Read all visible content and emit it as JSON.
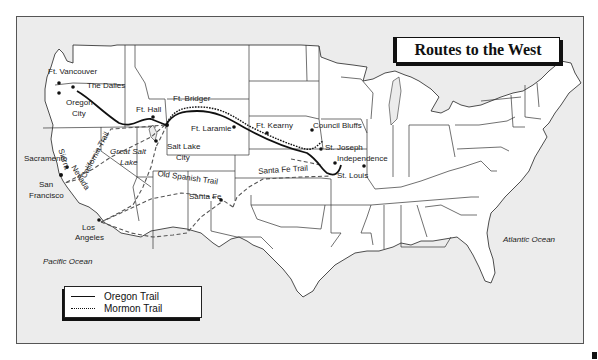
{
  "map": {
    "title": "Routes to the West",
    "legend": [
      {
        "label": "Oregon Trail",
        "style": "solid"
      },
      {
        "label": "Mormon Trail",
        "style": "dotted"
      }
    ],
    "water_labels": {
      "pacific": "Pacific Ocean",
      "atlantic": "Atlantic Ocean",
      "great_salt_lake_1": "Great Salt",
      "great_salt_lake_2": "Lake"
    },
    "places": {
      "ft_vancouver": "Ft. Vancouver",
      "the_dalles": "The Dalles",
      "oregon_city_1": "Oregon",
      "oregon_city_2": "City",
      "ft_hall": "Ft. Hall",
      "ft_bridger": "Ft. Bridger",
      "ft_laramie": "Ft. Laramie",
      "ft_kearny": "Ft. Kearny",
      "council_bluffs": "Council Bluffs",
      "st_joseph": "St. Joseph",
      "independence": "Independence",
      "st_louis": "St. Louis",
      "salt_lake_city_1": "Salt Lake",
      "salt_lake_city_2": "City",
      "sacramento": "Sacramento",
      "san_francisco_1": "San",
      "san_francisco_2": "Francisco",
      "los_angeles_1": "Los",
      "los_angeles_2": "Angeles",
      "santa_fe": "Santa Fe"
    },
    "trail_labels": {
      "california": "California Trail",
      "old_spanish": "Old Spanish Trail",
      "santa_fe": "Santa Fe Trail",
      "sierra_nevada_1": "Sierra",
      "sierra_nevada_2": "Nevada"
    },
    "colors": {
      "land": "#ffffff",
      "water": "#ececec",
      "lines": "#111111"
    }
  }
}
